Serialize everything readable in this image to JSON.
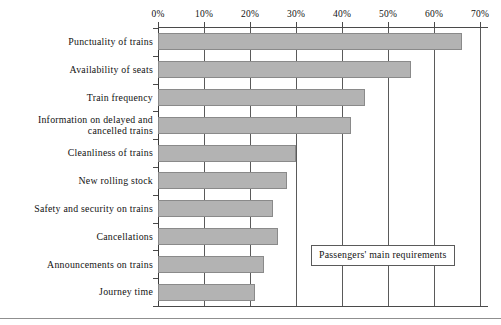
{
  "chart_data": {
    "type": "bar",
    "orientation": "horizontal",
    "title": "",
    "legend_label": "Passengers' main requirements",
    "legend_position": "inside-lower-right",
    "xlabel": "",
    "ylabel": "",
    "xlim": [
      0,
      70
    ],
    "grid": true,
    "grid_axis": "x",
    "tick_suffix": "%",
    "tick_labels": [
      "0%",
      "10%",
      "20%",
      "30%",
      "40%",
      "50%",
      "60%",
      "70%"
    ],
    "tick_values": [
      0,
      10,
      20,
      30,
      40,
      50,
      60,
      70
    ],
    "categories": [
      "Punctuality of trains",
      "Availability of seats",
      "Train frequency",
      "Information on delayed and\ncancelled trains",
      "Cleanliness of trains",
      "New rolling stock",
      "Safety and security on trains",
      "Cancellations",
      "Announcements on trains",
      "Journey time"
    ],
    "values": [
      66,
      55,
      45,
      42,
      30,
      28,
      25,
      26,
      23,
      21
    ],
    "bar_color": "#b3b3b3",
    "bar_border_color": "#8a8a8a",
    "axis_color": "#4a4a4a",
    "gridline_color": "#5a5a5a"
  }
}
